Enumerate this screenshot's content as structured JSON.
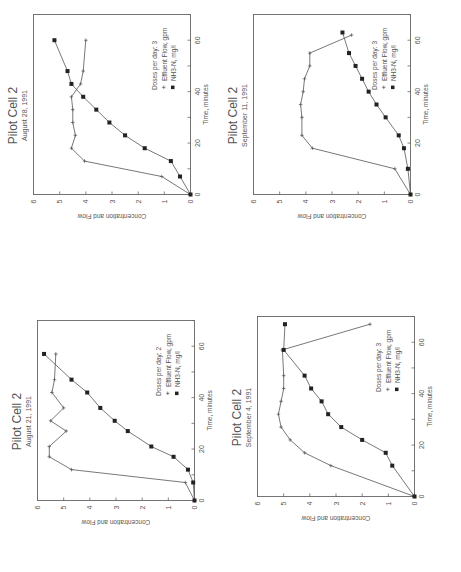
{
  "chart_data": [
    {
      "id": "aug28",
      "type": "line",
      "title": "Pilot Cell 2",
      "subtitle": "August 28, 1991",
      "xlabel": "Time, minutes",
      "ylabel": "Concentration and Flow",
      "xlim": [
        0,
        70
      ],
      "ylim": [
        0,
        6
      ],
      "xticks": [
        0,
        20,
        40,
        60
      ],
      "yticks": [
        0,
        1,
        2,
        3,
        4,
        5,
        6
      ],
      "legend_title": "Doses per day:  3",
      "series": [
        {
          "name": "Effluent Flow, gpm",
          "marker": "plus",
          "x": [
            0,
            7,
            13,
            18,
            23,
            28,
            33,
            38,
            43,
            48,
            60
          ],
          "values": [
            0,
            1.1,
            4.05,
            4.55,
            4.4,
            4.5,
            4.5,
            4.55,
            4.2,
            4.1,
            4.0
          ]
        },
        {
          "name": "NH3-N, mg/l",
          "marker": "square",
          "x": [
            0,
            7,
            13,
            18,
            23,
            28,
            33,
            38,
            43,
            48,
            60
          ],
          "values": [
            0,
            0.4,
            0.75,
            1.75,
            2.5,
            3.1,
            3.6,
            4.1,
            4.55,
            4.7,
            5.2
          ]
        }
      ]
    },
    {
      "id": "sep11",
      "type": "line",
      "title": "Pilot Cell 2",
      "subtitle": "September 11, 1991",
      "xlabel": "Time, minutes",
      "ylabel": "Concentration and Flow",
      "xlim": [
        0,
        70
      ],
      "ylim": [
        0,
        6
      ],
      "xticks": [
        0,
        20,
        40,
        60
      ],
      "yticks": [
        0,
        1,
        2,
        3,
        4,
        5,
        6
      ],
      "legend_title": "Doses per day:  3",
      "series": [
        {
          "name": "Effluent Flow, gpm",
          "marker": "plus",
          "x": [
            0,
            10,
            18,
            23,
            30,
            35,
            40,
            45,
            50,
            55,
            62
          ],
          "values": [
            0,
            0.6,
            3.75,
            4.15,
            4.15,
            4.2,
            4.1,
            4.05,
            3.85,
            3.85,
            2.25
          ]
        },
        {
          "name": "NH3-N, mg/l",
          "marker": "square",
          "x": [
            0,
            10,
            18,
            23,
            30,
            35,
            40,
            45,
            50,
            55,
            63
          ],
          "values": [
            0,
            0.1,
            0.25,
            0.45,
            0.95,
            1.3,
            1.6,
            1.85,
            2.1,
            2.35,
            2.6
          ]
        }
      ]
    },
    {
      "id": "aug21",
      "type": "line",
      "title": "Pilot Cell 2",
      "subtitle": "August 21, 1991",
      "xlabel": "Time, minutes",
      "ylabel": "Concentration and Flow",
      "xlim": [
        0,
        70
      ],
      "ylim": [
        0,
        6
      ],
      "xticks": [
        0,
        20,
        40,
        60
      ],
      "yticks": [
        0,
        1,
        2,
        3,
        4,
        5,
        6
      ],
      "legend_title": "Doses per day:  2",
      "series": [
        {
          "name": "Effluent Flow, gpm",
          "marker": "plus",
          "x": [
            0,
            7,
            12,
            17,
            21,
            27,
            31,
            36,
            42,
            47,
            57
          ],
          "values": [
            0,
            0.35,
            4.7,
            5.55,
            5.55,
            4.9,
            5.5,
            5.0,
            5.45,
            5.35,
            5.3
          ]
        },
        {
          "name": "NH3-N, mg/l",
          "marker": "square",
          "x": [
            0,
            7,
            12,
            17,
            21,
            27,
            31,
            36,
            42,
            47,
            57
          ],
          "values": [
            0,
            0.05,
            0.25,
            0.8,
            1.65,
            2.55,
            3.05,
            3.6,
            4.1,
            4.7,
            5.75
          ]
        }
      ]
    },
    {
      "id": "sep4",
      "type": "line",
      "title": "Pilot Cell 2",
      "subtitle": "September 4, 1991",
      "xlabel": "Time, minutes",
      "ylabel": "Concentration and Flow",
      "xlim": [
        0,
        70
      ],
      "ylim": [
        0,
        6
      ],
      "xticks": [
        0,
        20,
        40,
        60
      ],
      "yticks": [
        0,
        1,
        2,
        3,
        4,
        5,
        6
      ],
      "legend_title": "Doses per day:  3",
      "series": [
        {
          "name": "Effluent Flow, gpm",
          "marker": "plus",
          "x": [
            0,
            12,
            17,
            22,
            27,
            32,
            37,
            42,
            47,
            57,
            67
          ],
          "values": [
            0,
            3.2,
            4.2,
            4.75,
            5.1,
            5.2,
            5.1,
            5.0,
            5.0,
            5.05,
            1.7
          ]
        },
        {
          "name": "NH3-N, mg/l",
          "marker": "square",
          "x": [
            0,
            12,
            17,
            22,
            27,
            32,
            37,
            42,
            47,
            57,
            67
          ],
          "values": [
            0,
            0.85,
            1.1,
            2.0,
            2.8,
            3.3,
            3.55,
            3.95,
            4.2,
            5.0,
            4.95
          ]
        }
      ]
    }
  ],
  "layout": {
    "panels": [
      {
        "chart": 0,
        "left": 2,
        "top": 0
      },
      {
        "chart": 1,
        "left": 222,
        "top": 0
      },
      {
        "chart": 2,
        "left": 6,
        "top": 306
      },
      {
        "chart": 3,
        "left": 226,
        "top": 302
      }
    ]
  }
}
